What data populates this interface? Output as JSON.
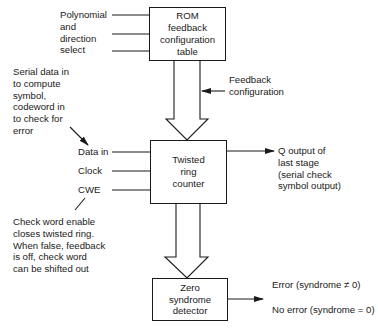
{
  "blocks": {
    "rom": {
      "lines": [
        "ROM",
        "feedback",
        "configuration",
        "table"
      ]
    },
    "twisted": {
      "lines": [
        "Twisted",
        "ring",
        "counter"
      ]
    },
    "zero": {
      "lines": [
        "Zero",
        "syndrome",
        "detector"
      ]
    }
  },
  "labels": {
    "polynomial_select": [
      "Polynomial",
      "and",
      "direction",
      "select"
    ],
    "feedback_config": [
      "Feedback",
      "configuration"
    ],
    "serial_data_note": [
      "Serial data in",
      "to compute",
      "symbol,",
      "codeword in",
      "to check for",
      "error"
    ],
    "inputs": {
      "data_in": "Data in",
      "clock": "Clock",
      "cwe": "CWE"
    },
    "cwe_note": [
      "Check word enable",
      "closes twisted ring.",
      "When false, feedback",
      "is off, check word",
      "can be shifted out"
    ],
    "q_output": [
      "Q output of",
      "last stage",
      "(serial check",
      "symbol output)"
    ],
    "error": "Error (syndrome ≠ 0)",
    "no_error": "No error (syndrome = 0)"
  }
}
